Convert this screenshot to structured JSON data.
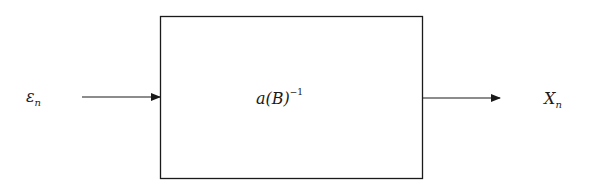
{
  "diagram": {
    "type": "block-diagram",
    "input": {
      "symbol": "ε",
      "subscript": "n"
    },
    "block": {
      "base": "a(B)",
      "superscript": "−1"
    },
    "output": {
      "symbol": "X",
      "subscript": "n"
    },
    "edges": [
      {
        "from": "input",
        "to": "block"
      },
      {
        "from": "block",
        "to": "output"
      }
    ]
  }
}
